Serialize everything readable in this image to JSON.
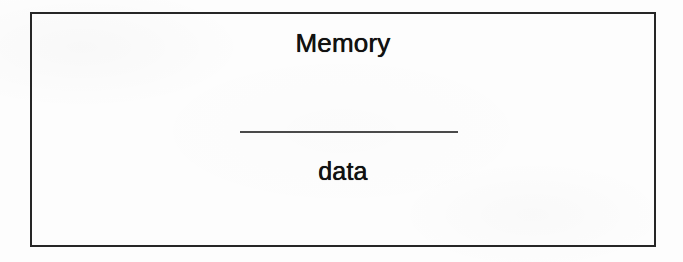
{
  "diagram": {
    "type": "block-diagram",
    "background_color": "#fdfdfd",
    "frame": {
      "name": "outer-frame",
      "border_color": "#262626"
    },
    "blocks": [
      {
        "id": "memory-block-left",
        "title": "Memory",
        "body": "data",
        "fill_color": "#d2d2d2",
        "border_color": "#6b6b6b"
      },
      {
        "id": "memory-block-right",
        "title": "Memory",
        "body": "data",
        "fill_color": "#d2d2d2",
        "border_color": "#6b6b6b"
      }
    ],
    "connector": {
      "name": "connection-line",
      "style": "solid",
      "color": "#4a4a4a",
      "from": "memory-block-left",
      "to": "memory-block-right"
    }
  }
}
